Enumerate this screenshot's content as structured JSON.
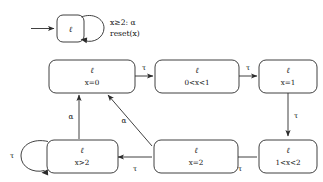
{
  "figure": {
    "top_automaton": {
      "state": {
        "location": "ℓ"
      },
      "self_loop_guard_line1": "x⊧2: α",
      "self_loop_guard_line2": "reset(x)",
      "guard_text_line1": "x≥2: α",
      "guard_text_line2": "reset(x)",
      "initial_arrow": "initial-state-arrow"
    },
    "region_graph": {
      "nodes": [
        {
          "id": "n0",
          "location": "ℓ",
          "constraint": "x=0"
        },
        {
          "id": "n1",
          "location": "ℓ",
          "constraint": "0<x<1"
        },
        {
          "id": "n2",
          "location": "ℓ",
          "constraint": "x=1"
        },
        {
          "id": "n3",
          "location": "ℓ",
          "constraint": "1<x<2"
        },
        {
          "id": "n4",
          "location": "ℓ",
          "constraint": "x=2"
        },
        {
          "id": "n5",
          "location": "ℓ",
          "constraint": "x>2"
        }
      ],
      "edges": [
        {
          "from": "n0",
          "to": "n1",
          "label": "τ"
        },
        {
          "from": "n1",
          "to": "n2",
          "label": "τ"
        },
        {
          "from": "n2",
          "to": "n3",
          "label": "τ"
        },
        {
          "from": "n3",
          "to": "n4",
          "label": "τ"
        },
        {
          "from": "n4",
          "to": "n5",
          "label": "τ"
        },
        {
          "from": "n5",
          "to": "n5",
          "label": "τ"
        },
        {
          "from": "n5",
          "to": "n0",
          "label": "α"
        },
        {
          "from": "n4",
          "to": "n0",
          "label": "α"
        }
      ]
    }
  }
}
